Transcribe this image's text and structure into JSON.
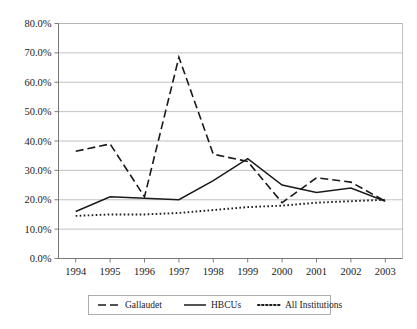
{
  "chart_data": {
    "type": "line",
    "title": "",
    "xlabel": "",
    "ylabel": "",
    "categories": [
      "1994",
      "1995",
      "1996",
      "1997",
      "1998",
      "1999",
      "2000",
      "2001",
      "2002",
      "2003"
    ],
    "ylim": [
      0,
      80
    ],
    "ytick_values": [
      0,
      10,
      20,
      30,
      40,
      50,
      60,
      70,
      80
    ],
    "ytick_labels": [
      "0.0%",
      "10.0%",
      "20.0%",
      "30.0%",
      "40.0%",
      "50.0%",
      "60.0%",
      "70.0%",
      "80.0%"
    ],
    "grid": true,
    "legend_position": "bottom",
    "series": [
      {
        "name": "Gallaudet",
        "style": "dashed",
        "values": [
          36.5,
          39.0,
          21.0,
          68.5,
          35.5,
          33.0,
          19.0,
          27.5,
          26.0,
          19.5
        ]
      },
      {
        "name": "HBCUs",
        "style": "solid",
        "values": [
          16.0,
          21.0,
          20.5,
          20.0,
          26.5,
          34.0,
          25.0,
          22.5,
          24.0,
          19.5
        ]
      },
      {
        "name": "All Institutions",
        "style": "dotted",
        "values": [
          14.5,
          15.0,
          15.0,
          15.5,
          16.5,
          17.5,
          18.0,
          19.0,
          19.5,
          20.0
        ]
      }
    ]
  },
  "legend": {
    "items": [
      {
        "label": "Gallaudet",
        "style": "dashed"
      },
      {
        "label": "HBCUs",
        "style": "solid"
      },
      {
        "label": "All Institutions",
        "style": "dotted"
      }
    ]
  }
}
